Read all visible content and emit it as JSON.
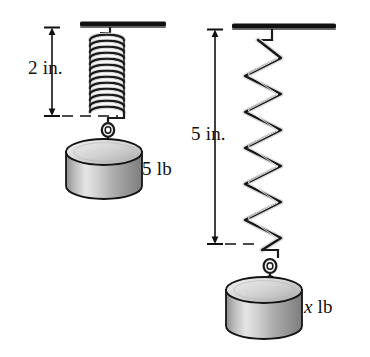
{
  "figure": {
    "background_color": "#ffffff",
    "ink_color": "#111111"
  },
  "labels": {
    "left_dimension": "2 in.",
    "left_weight": "5 lb",
    "right_dimension": "5 in.",
    "right_weight_value": "x",
    "right_weight_unit": "lb"
  },
  "systems": [
    {
      "name": "left-spring-system",
      "dimension_label": "2 in.",
      "weight_label": "5 lb",
      "spring_state": "compressed",
      "coil_count": 14,
      "ceiling_bar": {
        "x1": 80,
        "x2": 166,
        "y": 24
      },
      "spring": {
        "top": 34,
        "bottom": 116,
        "left": 88,
        "right": 126
      },
      "dimension_line": {
        "x": 52,
        "top": 27,
        "bottom": 116
      },
      "dashed_line": {
        "y": 116,
        "x1": 38,
        "x2": 118
      },
      "cylinder": {
        "cx": 104,
        "top": 152,
        "width": 76,
        "body_height": 34
      }
    },
    {
      "name": "right-spring-system",
      "dimension_label": "5 in.",
      "weight_label": "x lb",
      "spring_state": "stretched",
      "coil_count": 11,
      "ceiling_bar": {
        "x1": 232,
        "x2": 336,
        "y": 26
      },
      "spring": {
        "top": 36,
        "bottom": 246,
        "left": 243,
        "right": 282
      },
      "dimension_line": {
        "x": 215,
        "top": 29,
        "bottom": 244
      },
      "dashed_line": {
        "y": 244,
        "x1": 205,
        "x2": 252
      },
      "cylinder": {
        "cx": 264,
        "top": 290,
        "width": 76,
        "body_height": 36
      }
    }
  ],
  "colors": {
    "outline": "#111111",
    "metal_dark": "#4a4a4a",
    "metal_mid": "#9a9a9a",
    "metal_light": "#e8e8e8",
    "cylinder_top": "#d8d8d8",
    "cylinder_body_light": "#eeeeee",
    "cylinder_body_dark": "#8f8f8f"
  }
}
